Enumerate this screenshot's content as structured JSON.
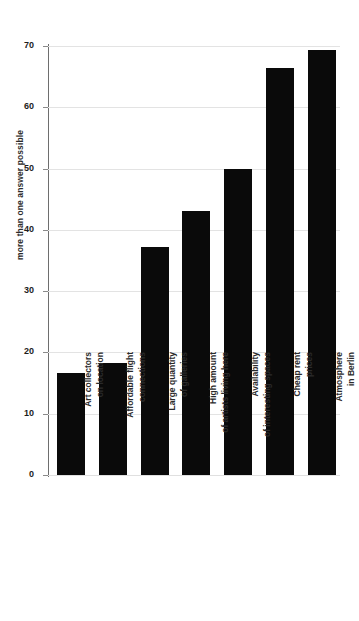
{
  "chart_data": {
    "type": "bar",
    "title": "",
    "subtitle": "",
    "xlabel": "",
    "ylabel": "more than one answer possible",
    "ylim": [
      0,
      72
    ],
    "grid": true,
    "legend": "none",
    "orientation": "vertical",
    "bar_color": "#0a0a0a",
    "gridline_color": "#e3e3e3",
    "axis_color": "#6e6e6e",
    "yticks": [
      0,
      10,
      20,
      30,
      40,
      50,
      60,
      70
    ],
    "ytick_labels": [
      "0",
      "10",
      "20",
      "30",
      "40",
      "50",
      "60",
      "70"
    ],
    "categories": [
      "Art collectors on location",
      "Affordable flight connections",
      "Large quantity of galleries",
      "High amount of artists living here",
      "Availability of interesting spaces",
      "Cheap rent prices",
      "Atmosphere in Berlin"
    ],
    "category_lines": [
      [
        "Art collectors",
        "on location"
      ],
      [
        "Affordable flight",
        "connections"
      ],
      [
        "Large quantity",
        "of galleries"
      ],
      [
        "High amount",
        "of artists living here"
      ],
      [
        "Availability",
        "of interesting spaces"
      ],
      [
        "Cheap rent",
        "prices"
      ],
      [
        "Atmosphere",
        "in Berlin"
      ]
    ],
    "values": [
      16.6,
      18.2,
      37.2,
      43.0,
      50.0,
      66.4,
      69.3
    ]
  }
}
